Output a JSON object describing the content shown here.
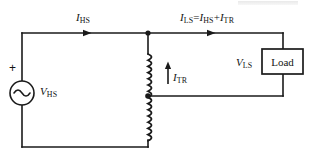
{
  "diagram": {
    "type": "electrical-schematic",
    "colors": {
      "wire": "#1a1a1a",
      "text": "#141414",
      "background": "#ffffff"
    },
    "labels": {
      "current_hs": {
        "symbol": "I",
        "subscript": "HS"
      },
      "current_ls_equation": {
        "symbol": "I",
        "subscript": "LS",
        "equals": "=",
        "term1_symbol": "I",
        "term1_subscript": "HS",
        "plus": "+",
        "term2_symbol": "I",
        "term2_subscript": "TR",
        "full_text": "ILS =IHS + ITR"
      },
      "current_tr": {
        "symbol": "I",
        "subscript": "TR"
      },
      "voltage_hs": {
        "symbol": "V",
        "subscript": "HS"
      },
      "voltage_ls": {
        "symbol": "V",
        "subscript": "LS"
      },
      "source_polarity": "+",
      "load_box": "Load"
    },
    "components": {
      "source": {
        "name": "ac-voltage-source",
        "label": "VHS",
        "polarity": "+",
        "cx": 22,
        "cy": 93,
        "r": 12
      },
      "winding": {
        "name": "autotransformer-winding",
        "orientation": "vertical",
        "x": 148,
        "top_y": 54,
        "bottom_y": 140,
        "tap_y": 96
      },
      "load": {
        "name": "load-block",
        "label": "Load",
        "x": 262,
        "y": 49,
        "width": 41,
        "height": 25
      }
    },
    "nodes": {
      "top_junction": {
        "x": 148,
        "y": 33
      },
      "tap_junction": {
        "x": 148,
        "y": 96
      }
    },
    "current_arrows": [
      {
        "name": "ihs-arrow",
        "x": 88,
        "y": 33,
        "direction": "right"
      },
      {
        "name": "ils-arrow",
        "x": 212,
        "y": 33,
        "direction": "right"
      },
      {
        "name": "itr-arrow",
        "x": 168,
        "y": 68,
        "direction": "up"
      }
    ]
  }
}
